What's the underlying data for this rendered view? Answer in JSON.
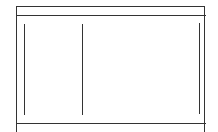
{
  "diagram": {
    "type": "wireframe-layout",
    "regions": [
      {
        "name": "header-bar",
        "label": ""
      },
      {
        "name": "left-column",
        "label": ""
      },
      {
        "name": "main-column",
        "label": ""
      },
      {
        "name": "footer-bar",
        "label": ""
      }
    ],
    "stroke_color": "#333333",
    "background_color": "#ffffff"
  }
}
